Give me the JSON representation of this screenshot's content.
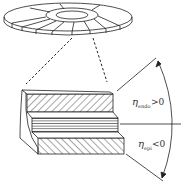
{
  "diagram": {
    "type": "schematic",
    "colors": {
      "stroke": "#222222",
      "background": "#ffffff"
    },
    "labels": {
      "upper": {
        "symbol": "η",
        "subscript": "endo",
        "relation": ">0"
      },
      "lower": {
        "symbol": "η",
        "subscript": "epi",
        "relation": "<0"
      }
    },
    "layers": [
      {
        "name": "top-layer",
        "pattern": "diagonal-hatch"
      },
      {
        "name": "middle-layer",
        "pattern": "horizontal-lines"
      },
      {
        "name": "bottom-layer",
        "pattern": "diagonal-hatch-reverse"
      }
    ]
  }
}
